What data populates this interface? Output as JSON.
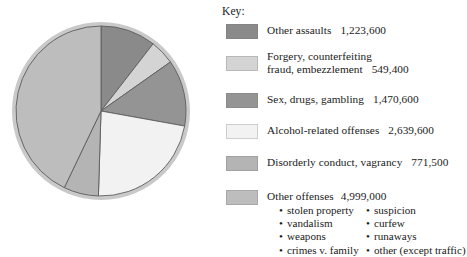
{
  "legend": {
    "title": "Key:",
    "items": [
      {
        "label": "Other assaults",
        "label_line2": "",
        "value": "1,223,600",
        "color": "#8a8a8a",
        "numeric": 1223600,
        "percent": 10.5
      },
      {
        "label": "Forgery, counterfeiting",
        "label_line2": "fraud, embezzlement",
        "value": "549,400",
        "color": "#d4d4d4",
        "numeric": 549400,
        "percent": 4.7
      },
      {
        "label": "Sex, drugs, gambling",
        "label_line2": "",
        "value": "1,470,600",
        "color": "#949494",
        "numeric": 1470600,
        "percent": 12.6
      },
      {
        "label": "Alcohol-related offenses",
        "label_line2": "",
        "value": "2,639,600",
        "color": "#f2f2f2",
        "numeric": 2639600,
        "percent": 22.7
      },
      {
        "label": "Disorderly conduct, vagrancy",
        "label_line2": "",
        "value": "771,500",
        "color": "#b4b4b4",
        "numeric": 771500,
        "percent": 6.6
      },
      {
        "label": "Other offenses",
        "label_line2": "",
        "value": "4,999,000",
        "color": "#bdbdbd",
        "numeric": 4999000,
        "percent": 42.9
      }
    ],
    "sublist": [
      {
        "left": "stolen property",
        "right": "suspicion"
      },
      {
        "left": "vandalism",
        "right": "curfew"
      },
      {
        "left": "weapons",
        "right": "runaways"
      },
      {
        "left": "crimes v. family",
        "right": "other (except traffic)"
      }
    ],
    "bullet_glyph": "•"
  },
  "chart_data": {
    "type": "pie",
    "title": "",
    "categories": [
      "Other assaults",
      "Forgery, counterfeiting fraud, embezzlement",
      "Sex, drugs, gambling",
      "Alcohol-related offenses",
      "Disorderly conduct, vagrancy",
      "Other offenses"
    ],
    "values": [
      1223600,
      549400,
      1470600,
      2639600,
      771500,
      4999000
    ],
    "value_labels": [
      "1,223,600",
      "549,400",
      "1,470,600",
      "2,639,600",
      "771,500",
      "4,999,000"
    ],
    "percentages": [
      10.5,
      4.7,
      12.6,
      22.7,
      6.6,
      42.9
    ],
    "colors": [
      "#8a8a8a",
      "#d4d4d4",
      "#949494",
      "#f2f2f2",
      "#b4b4b4",
      "#bdbdbd"
    ],
    "total": 11653700,
    "start_angle_deg": 0,
    "direction": "clockwise",
    "legend_position": "right",
    "grid": false,
    "xlabel": "",
    "ylabel": ""
  },
  "style": {
    "pie_center_x": 101,
    "pie_center_y": 111,
    "pie_radius": 89,
    "pie_rim_color": "#c9c9c9",
    "slice_stroke": "#5c5c5c"
  }
}
